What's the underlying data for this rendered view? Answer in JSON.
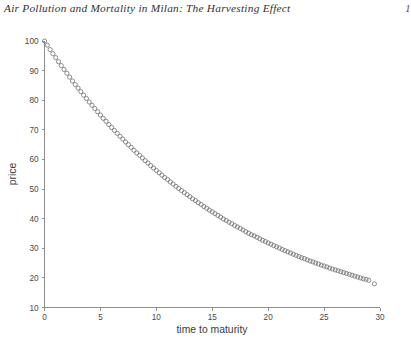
{
  "header": {
    "title": "Air Pollution and Mortality in Milan: The Harvesting Effect",
    "page_number": "1"
  },
  "figure": {
    "marker_shape": "open-circle",
    "marker_color": "#6b6b6b",
    "axis_color": "#8e8e8e",
    "background": "#ffffff"
  },
  "chart_data": {
    "type": "scatter",
    "title": "",
    "subtitle": "",
    "xlabel": "time to maturity",
    "ylabel": "price",
    "xlim": [
      0,
      30
    ],
    "ylim": [
      10,
      100
    ],
    "xticks": [
      0,
      5,
      10,
      15,
      20,
      25,
      30
    ],
    "xticklabels": [
      "0",
      "5",
      "10",
      "15",
      "20",
      "25",
      "30"
    ],
    "yticks": [
      10,
      20,
      30,
      40,
      50,
      60,
      70,
      80,
      90,
      100
    ],
    "yticklabels": [
      "10",
      "20",
      "30",
      "40",
      "50",
      "60",
      "70",
      "80",
      "90",
      "100"
    ],
    "grid": false,
    "legend": null,
    "annotations": [],
    "series": [
      {
        "name": "discount price curve",
        "marker": "o",
        "linestyle": "none",
        "description": "Exponentially decaying bond price as a function of time to maturity, from 100 at t=0 down to about 18 at t=29.5",
        "x": [
          0,
          0.25,
          0.5,
          0.75,
          1,
          1.25,
          1.5,
          1.75,
          2,
          2.25,
          2.5,
          2.75,
          3,
          3.25,
          3.5,
          3.75,
          4,
          4.25,
          4.5,
          4.75,
          5,
          5.25,
          5.5,
          5.75,
          6,
          6.25,
          6.5,
          6.75,
          7,
          7.25,
          7.5,
          7.75,
          8,
          8.25,
          8.5,
          8.75,
          9,
          9.25,
          9.5,
          9.75,
          10,
          10.25,
          10.5,
          10.75,
          11,
          11.25,
          11.5,
          11.75,
          12,
          12.25,
          12.5,
          12.75,
          13,
          13.25,
          13.5,
          13.75,
          14,
          14.25,
          14.5,
          14.75,
          15,
          15.25,
          15.5,
          15.75,
          16,
          16.25,
          16.5,
          16.75,
          17,
          17.25,
          17.5,
          17.75,
          18,
          18.25,
          18.5,
          18.75,
          19,
          19.25,
          19.5,
          19.75,
          20,
          20.25,
          20.5,
          20.75,
          21,
          21.25,
          21.5,
          21.75,
          22,
          22.25,
          22.5,
          22.75,
          23,
          23.25,
          23.5,
          23.75,
          24,
          24.25,
          24.5,
          24.75,
          25,
          25.25,
          25.5,
          25.75,
          26,
          26.25,
          26.5,
          26.75,
          27,
          27.25,
          27.5,
          27.75,
          28,
          28.25,
          28.5,
          28.75,
          29,
          29.5
        ],
        "y": [
          100.0,
          98.6,
          97.1,
          95.7,
          94.4,
          93.0,
          91.7,
          90.4,
          89.1,
          87.8,
          86.5,
          85.3,
          84.1,
          82.9,
          81.7,
          80.6,
          79.4,
          78.3,
          77.2,
          76.1,
          75.0,
          73.9,
          72.9,
          71.8,
          70.8,
          69.8,
          68.8,
          67.8,
          66.9,
          65.9,
          65.0,
          64.1,
          63.1,
          62.2,
          61.4,
          60.5,
          59.6,
          58.8,
          57.9,
          57.1,
          56.3,
          55.5,
          54.7,
          53.9,
          53.2,
          52.4,
          51.7,
          50.9,
          50.2,
          49.5,
          48.8,
          48.1,
          47.4,
          46.7,
          46.1,
          45.4,
          44.8,
          44.1,
          43.5,
          42.9,
          42.3,
          41.7,
          41.1,
          40.5,
          39.9,
          39.4,
          38.8,
          38.3,
          37.7,
          37.2,
          36.7,
          36.2,
          35.6,
          35.1,
          34.6,
          34.2,
          33.7,
          33.2,
          32.7,
          32.3,
          31.8,
          31.4,
          30.9,
          30.5,
          30.1,
          29.6,
          29.2,
          28.8,
          28.4,
          28.0,
          27.6,
          27.2,
          26.8,
          26.5,
          26.1,
          25.7,
          25.4,
          25.0,
          24.7,
          24.3,
          24.0,
          23.7,
          23.3,
          23.0,
          22.7,
          22.4,
          22.1,
          21.8,
          21.5,
          21.2,
          20.9,
          20.6,
          20.3,
          20.0,
          19.7,
          19.5,
          19.2,
          18.0
        ]
      }
    ]
  }
}
